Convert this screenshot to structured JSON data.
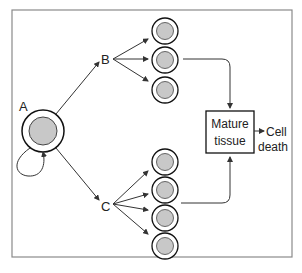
{
  "labels": {
    "stem_cell": "A",
    "progenitor_b": "B",
    "progenitor_c": "C",
    "mature_tissue_line1": "Mature",
    "mature_tissue_line2": "tissue",
    "cell_death_line1": "Cell",
    "cell_death_line2": "death"
  },
  "colors": {
    "frame": "#8a8a8a",
    "line": "#333333",
    "cell_fill": "#c8c8c8",
    "cell_outline": "#111111"
  },
  "groups": {
    "b_daughters": 3,
    "c_daughters": 4
  }
}
